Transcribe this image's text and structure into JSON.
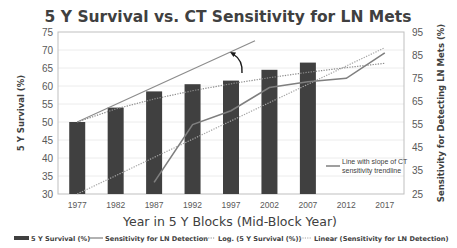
{
  "chart_data": {
    "type": "bar",
    "title": "5 Y Survival vs. CT Sensitivity for LN Mets",
    "xlabel": "Year in 5 Y Blocks (Mid-Block Year)",
    "ylabel": "5 Y Survival (%)",
    "y2label": "Sensitivity for Detecting LN Mets (%)",
    "categories": [
      "1977",
      "1982",
      "1987",
      "1992",
      "1997",
      "2002",
      "2007",
      "2012",
      "2017"
    ],
    "ylim": [
      30,
      75
    ],
    "yticks": [
      30,
      35,
      40,
      45,
      50,
      55,
      60,
      65,
      70,
      75
    ],
    "y2lim": [
      25,
      95
    ],
    "y2ticks": [
      25,
      35,
      45,
      55,
      65,
      75,
      85,
      95
    ],
    "grid": true,
    "legend_position": "bottom",
    "series": [
      {
        "name": "5 Y Survival (%)",
        "type": "bar",
        "axis": "left",
        "color": "#404040",
        "values": [
          50,
          54,
          58.5,
          60.5,
          61.5,
          64.5,
          66.5,
          null,
          null
        ]
      },
      {
        "name": "Sensitivity for LN Detection",
        "type": "line",
        "axis": "right",
        "color": "#7f7f7f",
        "values": [
          null,
          null,
          30,
          55,
          61,
          71,
          73.5,
          75,
          86
        ]
      },
      {
        "name": "Log. (5 Y Survival (%))",
        "type": "trendline-log",
        "axis": "left",
        "style": "dotted",
        "color": "#8c8c8c",
        "values": [
          50,
          53.6,
          56.4,
          58.7,
          60.6,
          62.3,
          63.8,
          65.1,
          66.3
        ]
      },
      {
        "name": "Linear (Sensitivity for LN Detection)",
        "type": "trendline-linear",
        "axis": "right",
        "style": "dotted",
        "color": "#a6a6a6",
        "values": [
          25,
          32.9,
          40.8,
          48.7,
          56.6,
          64.5,
          72.4,
          80.3,
          88.2
        ]
      }
    ],
    "annotations": [
      {
        "text": "Line with slope of CT sensitivity trendline",
        "type": "reference-line",
        "from": [
          "1977",
          50
        ],
        "to": [
          "1997",
          72
        ]
      },
      {
        "text": "",
        "type": "curved-arrow",
        "note": "arrow from log trendline up to slope line near 1992-1997"
      }
    ]
  },
  "legend": {
    "items": [
      {
        "label": "5 Y Survival (%)"
      },
      {
        "label": "Sensitivity for LN Detection"
      },
      {
        "label": "Log. (5 Y Survival (%))"
      },
      {
        "label": "Linear (Sensitivity for LN Detection)"
      }
    ]
  },
  "annotation": {
    "line1": "Line with slope of CT",
    "line2": "sensitivity trendline"
  }
}
